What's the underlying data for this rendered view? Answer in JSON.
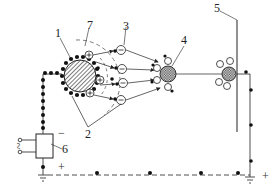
{
  "diagram": {
    "type": "electrostatic-separation-schematic",
    "labels": {
      "l1": "1",
      "l2": "2",
      "l3": "3",
      "l4": "4",
      "l5": "5",
      "l6": "6",
      "l7": "7"
    },
    "symbols": {
      "minus": "−",
      "plus_source": "+",
      "plus_ground": "+",
      "ac": "~"
    },
    "components": [
      {
        "id": "1",
        "name": "charged drum (electrode)"
      },
      {
        "id": "2",
        "name": "field boundary lines"
      },
      {
        "id": "3",
        "name": "negative ion"
      },
      {
        "id": "4",
        "name": "particle with attached ions"
      },
      {
        "id": "5",
        "name": "collecting plate"
      },
      {
        "id": "6",
        "name": "high-voltage power supply"
      },
      {
        "id": "7",
        "name": "corona zone boundary"
      }
    ],
    "colors": {
      "stroke": "#222222",
      "background": "#ffffff"
    }
  }
}
